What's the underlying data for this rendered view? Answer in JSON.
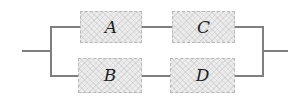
{
  "diagram": {
    "type": "series-parallel-block-diagram",
    "blocks": [
      {
        "id": "A",
        "label": "A"
      },
      {
        "id": "B",
        "label": "B"
      },
      {
        "id": "C",
        "label": "C"
      },
      {
        "id": "D",
        "label": "D"
      }
    ],
    "top_branch": [
      "A",
      "C"
    ],
    "bottom_branch": [
      "B",
      "D"
    ]
  },
  "colors": {
    "wire": "#7f7f7f",
    "block_fill": "#ececec",
    "block_border": "#b8b8b8",
    "label": "#1f1f1f",
    "background": "#ffffff"
  }
}
